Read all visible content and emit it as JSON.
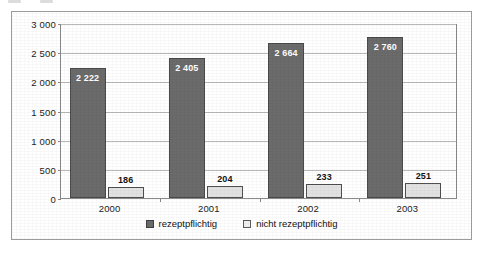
{
  "figure": {
    "background_color": "#ffffff",
    "border_color": "#9b9b9b"
  },
  "chart_data": {
    "type": "bar",
    "title": "",
    "subtitle": "",
    "xlabel": "",
    "ylabel": "",
    "categories": [
      "2000",
      "2001",
      "2002",
      "2003"
    ],
    "series": [
      {
        "name": "rezeptpflichtig",
        "color": "#6b6b6b",
        "values": [
          2222,
          2405,
          2664,
          2760
        ],
        "value_labels": [
          "2 222",
          "2 405",
          "2 664",
          "2 760"
        ],
        "label_position": "inside-top",
        "label_color": "#ffffff"
      },
      {
        "name": "nicht rezeptpflichtig",
        "color": "#e2e2e2",
        "values": [
          186,
          204,
          233,
          251
        ],
        "value_labels": [
          "186",
          "204",
          "233",
          "251"
        ],
        "label_position": "above",
        "label_color": "#141414"
      }
    ],
    "ylim": [
      0,
      3000
    ],
    "ytick_values": [
      0,
      500,
      1000,
      1500,
      2000,
      2500,
      3000
    ],
    "ytick_labels": [
      "0",
      "500",
      "1 000",
      "1 500",
      "2 000",
      "2 500",
      "3 000"
    ],
    "grid": "horizontal",
    "legend_position": "bottom-center",
    "legend_entries": [
      "rezeptpflichtig",
      "nicht rezeptpflichtig"
    ]
  }
}
